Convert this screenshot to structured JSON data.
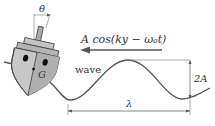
{
  "diagram": {
    "labels": {
      "theta": "θ",
      "wave_expression": "A cos(ky − ω₀t)",
      "wave": "wave",
      "center_of_gravity": "G",
      "amplitude": "2A",
      "wavelength": "λ"
    },
    "colors": {
      "line": "#555555",
      "hull_fill": "#c8c8c8",
      "hull_dark": "#9a9a9a",
      "deck_fill": "#b8b8b8",
      "eye": "#111111",
      "background": "#ffffff"
    },
    "elements": [
      "boat",
      "mast",
      "tilt-angle-theta",
      "wave-direction-arrow",
      "sinusoidal-wave",
      "amplitude-dimension",
      "wavelength-dimension"
    ]
  }
}
